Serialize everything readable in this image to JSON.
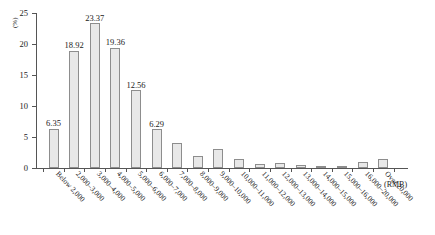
{
  "chart_data": {
    "type": "bar",
    "title": "",
    "xlabel": "(RMB)",
    "ylabel": "(%)",
    "ylim": [
      0,
      25
    ],
    "yticks": [
      0,
      5,
      10,
      15,
      20,
      25
    ],
    "ytick_labels": [
      "0",
      "5",
      "10",
      "15",
      "20",
      "25"
    ],
    "grid": false,
    "legend": null,
    "bar_color": "#e8e8e8",
    "bar_border_color": "#8d8d8d",
    "categories": [
      "Below 2,000",
      "2,000–3,000",
      "3,000–4,000",
      "4,000–5,000",
      "5,000–6,000",
      "6,000–7,000",
      "7,000–8,000",
      "8,000–9,000",
      "9,000–10,000",
      "10,000–11,000",
      "11,000–12,000",
      "12,000–13,000",
      "13,000–14,000",
      "14,000–15,000",
      "15,000–16,000",
      "16,000–20,000",
      "Over 20,000"
    ],
    "values": [
      6.35,
      18.92,
      23.37,
      19.36,
      12.56,
      6.29,
      4.0,
      1.9,
      3.0,
      1.4,
      0.6,
      0.8,
      0.5,
      0.4,
      0.3,
      0.9,
      1.4
    ],
    "labeled_values": [
      "6.35",
      "18.92",
      "23.37",
      "19.36",
      "12.56",
      "6.29",
      "",
      "",
      "",
      "",
      "",
      "",
      "",
      "",
      "",
      "",
      ""
    ]
  }
}
